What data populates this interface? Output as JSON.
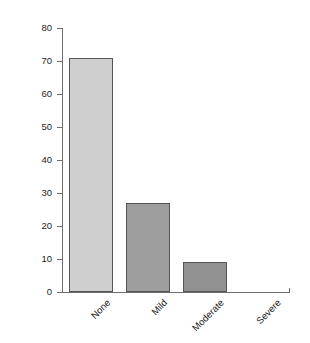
{
  "chart_data": {
    "type": "bar",
    "title": "",
    "subtitle": "",
    "xlabel": "",
    "ylabel": "",
    "categories": [
      "None",
      "Mild",
      "Moderate",
      "Severe"
    ],
    "values": [
      71,
      27,
      9,
      0
    ],
    "series": [
      {
        "name": "",
        "values": [
          71,
          27,
          9,
          0
        ]
      }
    ],
    "ylim": [
      0,
      80
    ],
    "yticks": [
      0,
      10,
      20,
      30,
      40,
      50,
      60,
      70,
      80
    ],
    "ytick_labels": [
      "0",
      "10",
      "20",
      "30",
      "40",
      "50",
      "60",
      "70",
      "80"
    ],
    "grid": false,
    "legend": false,
    "legend_position": "none",
    "annotations": [],
    "bar_colors": [
      "#cfcfcf",
      "#9e9e9e",
      "#919191",
      "#919191"
    ],
    "bar_edge_color": "#555555",
    "axis_color": "#6d6d6d",
    "text_color": "#1d1d1d",
    "background_color": "#ffffff",
    "xtick_label_rotation": -45
  }
}
